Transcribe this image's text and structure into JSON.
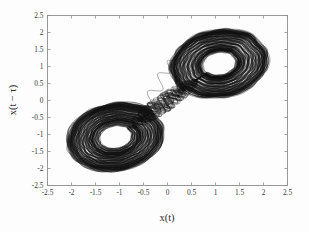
{
  "chart_data": {
    "type": "line",
    "title": "",
    "xlabel": "x(t)",
    "ylabel": "x(t − τ)",
    "xlim": [
      -2.5,
      2.5
    ],
    "ylim": [
      -2.5,
      2.5
    ],
    "grid": false,
    "legend": null,
    "xticks": [
      "-2.5",
      "-2",
      "-1.5",
      "-1",
      "-0.5",
      "0",
      "0.5",
      "1",
      "1.5",
      "2",
      "2.5"
    ],
    "xtick_values": [
      -2.5,
      -2,
      -1.5,
      -1,
      -0.5,
      0,
      0.5,
      1,
      1.5,
      2,
      2.5
    ],
    "yticks": [
      "2.5",
      "2",
      "1.5",
      "1",
      "0.5",
      "0",
      "-0.5",
      "-1",
      "-1.5",
      "-2",
      "-2.5"
    ],
    "ytick_values": [
      2.5,
      2,
      1.5,
      1,
      0.5,
      0,
      -0.5,
      -1,
      -1.5,
      -2,
      -2.5
    ],
    "series": [
      {
        "name": "attractor-trajectory",
        "color": "#111111",
        "linewidth": 0.38,
        "attractor": {
          "model": "duffing-delay-embedding",
          "lobe_centers": [
            [
              1.08,
              1.08
            ],
            [
              -1.08,
              -1.08
            ]
          ],
          "lobe_radius_outer": 1.12,
          "lobe_radius_inner": 0.34,
          "extent": [
            -2.2,
            2.2
          ],
          "revolutions_per_lobe": 26,
          "switches": 34,
          "points_per_revolution": 150,
          "braid_amplitude": 0.17,
          "braid_frequency": 11,
          "seed": 20250411
        }
      }
    ]
  },
  "axes": {
    "frame_color": "#8e8e8e",
    "background": "#fdfdfd",
    "tick_length": 3
  }
}
